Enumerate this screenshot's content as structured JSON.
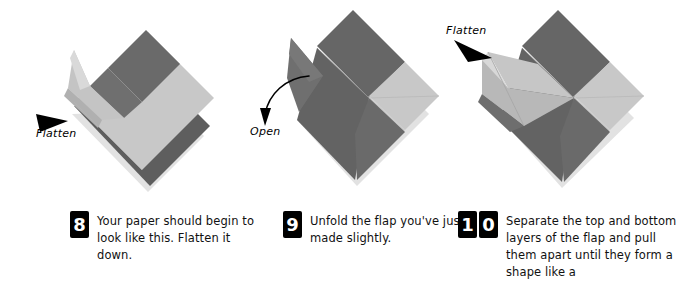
{
  "page": {
    "background_color": "#ffffff"
  },
  "palette": {
    "paper_dark": "#6a6a6a",
    "paper_dark_shaded": "#5e5e5e",
    "paper_light": "#c8c8c8",
    "paper_light_shaded": "#bdbdbd",
    "paper_highlight": "#dcdcdc",
    "ink": "#000000",
    "shadow": "#d8d8d8"
  },
  "figures": [
    {
      "id": "figure-step-8",
      "name": "origami-diagram-step-8",
      "description": "Rotated square of folded paper with a dark band across the upper left, a large light face, a dark band along the lower right edge, and a loose curled flap lifted on the left side.",
      "annotation": {
        "label": "Flatten",
        "arrow": "solid-triangle-pointing-right"
      }
    },
    {
      "id": "figure-step-9",
      "name": "origami-diagram-step-9",
      "description": "Diamond of folded paper with dark gray and light gray quadrants and a narrow pointed flap standing up on the left side.",
      "annotation": {
        "label": "Open",
        "arrow": "curved-arrow-pointing-down"
      }
    },
    {
      "id": "figure-step-10",
      "name": "origami-diagram-step-10",
      "description": "Diamond of folded paper with dark gray and light gray quadrants and a flattened triangular flap spread open on the left side.",
      "annotation": {
        "label": "Flatten",
        "arrow": "solid-triangle-pointing-down-right"
      }
    }
  ],
  "steps": [
    {
      "number": "8",
      "digits": [
        "8"
      ],
      "text": "Your paper should begin to look like this. Flatten it down."
    },
    {
      "number": "9",
      "digits": [
        "9"
      ],
      "text": "Unfold the flap you've just made slightly."
    },
    {
      "number": "10",
      "digits": [
        "1",
        "0"
      ],
      "text": "Separate the top and bottom layers of the flap and pull them apart until they form a shape like a"
    }
  ]
}
